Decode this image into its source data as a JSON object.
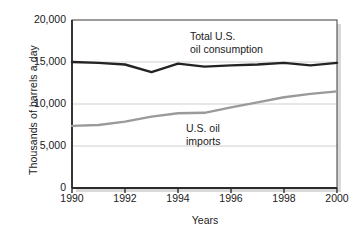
{
  "chart_data": {
    "type": "line",
    "title": "",
    "xlabel": "Years",
    "ylabel": "Thousands of barrels a day",
    "xlim": [
      1990,
      2000
    ],
    "ylim": [
      0,
      20000
    ],
    "grid": true,
    "grid_axis": "y",
    "legend_position": "inline-annotations",
    "x": [
      1990,
      1991,
      1992,
      1993,
      1994,
      1995,
      1996,
      1997,
      1998,
      1999,
      2000
    ],
    "xticks": [
      1990,
      1992,
      1994,
      1996,
      1998,
      2000
    ],
    "xtick_labels": [
      "1990",
      "1992",
      "1994",
      "1996",
      "1998",
      "2000"
    ],
    "yticks": [
      0,
      5000,
      10000,
      15000,
      20000
    ],
    "ytick_labels": [
      "0",
      "5,000",
      "10,000",
      "15,000",
      "20,000"
    ],
    "series": [
      {
        "name": "Total U.S. oil consumption",
        "annotation": "Total U.S.\noil consumption",
        "color": "#232323",
        "width": 2.4,
        "values": [
          15000,
          14900,
          14700,
          13800,
          14800,
          14450,
          14600,
          14700,
          14900,
          14600,
          14900
        ]
      },
      {
        "name": "U.S. oil imports",
        "annotation": "U.S. oil\nimports",
        "color": "#9a9a9a",
        "width": 2.4,
        "values": [
          7400,
          7500,
          7900,
          8500,
          8900,
          8950,
          9600,
          10200,
          10800,
          11200,
          11500
        ]
      }
    ]
  },
  "axes": {
    "ylabel": "Thousands of barrels a day",
    "xlabel": "Years",
    "ytick_labels": [
      "20,000",
      "15,000",
      "10,000",
      "5,000",
      "0"
    ],
    "xtick_labels": [
      "1990",
      "1992",
      "1994",
      "1996",
      "1998",
      "2000"
    ]
  },
  "annotations": {
    "consumption": "Total U.S.\noil consumption",
    "imports": "U.S. oil\nimports"
  },
  "colors": {
    "consumption_line": "#232323",
    "imports_line": "#9a9a9a",
    "frame": "#2b2b2b",
    "grid": "#cfcfcf",
    "shadow": "#d4d4d4",
    "background": "#ffffff",
    "text": "#1a1a1a"
  }
}
